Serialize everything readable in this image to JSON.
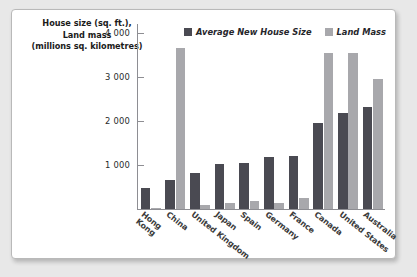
{
  "chart_data": {
    "type": "bar",
    "title": "",
    "ylabel": "House size (sq. ft.), Land mass (millions sq. kilometres)",
    "ylabel_lines": [
      "House size (sq. ft.),",
      "Land mass",
      "(millions sq. kilometres)"
    ],
    "xlabel": "",
    "ylim": [
      0,
      4200
    ],
    "yticks": [
      1000,
      2000,
      3000,
      4000
    ],
    "ytick_labels": [
      "1 000",
      "2 000",
      "3 000",
      "4 000"
    ],
    "grid": false,
    "legend_position": "top-right",
    "categories": [
      "Hong Kong",
      "China",
      "United Kingdom",
      "Japan",
      "Spain",
      "Germany",
      "France",
      "Canada",
      "United States",
      "Australia"
    ],
    "category_lines": [
      [
        "Hong",
        "Kong"
      ],
      [
        "China"
      ],
      [
        "United Kingdom"
      ],
      [
        "Japan"
      ],
      [
        "Spain"
      ],
      [
        "Germany"
      ],
      [
        "France"
      ],
      [
        "Canada"
      ],
      [
        "United States"
      ],
      [
        "Australia"
      ]
    ],
    "series": [
      {
        "name": "Average New House Size",
        "color": "#4a4a52",
        "values": [
          480,
          650,
          815,
          1030,
          1040,
          1170,
          1210,
          1960,
          2190,
          2320
        ]
      },
      {
        "name": "Land Mass",
        "color": "#a8a8ac",
        "values": [
          20,
          3650,
          80,
          130,
          190,
          140,
          250,
          3540,
          3540,
          2950
        ]
      }
    ]
  },
  "legend": {
    "items": [
      {
        "label": "Average New House Size",
        "color": "#4a4a52"
      },
      {
        "label": "Land Mass",
        "color": "#a8a8ac"
      }
    ]
  },
  "colors": {
    "dark_series": "#4a4a52",
    "light_series": "#a8a8ac",
    "axis": "#8e8e93",
    "card_background": "#ffffff",
    "page_background": "#e8e8e8"
  }
}
